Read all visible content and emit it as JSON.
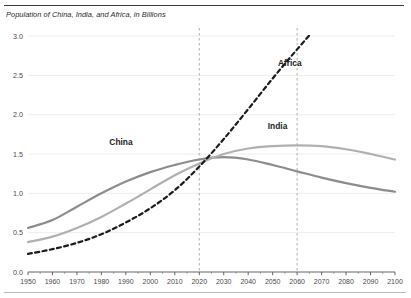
{
  "figure": {
    "title": "Population of China, India, and Africa, in Billions",
    "background": "#ffffff",
    "top_rule_color": "#3c3c3c",
    "bottom_rule_color": "#b9b9b9"
  },
  "chart_data": {
    "type": "line",
    "title": "Population of China, India, and Africa, in Billions",
    "xlabel": "",
    "ylabel": "",
    "xlim": [
      1950,
      2100
    ],
    "ylim": [
      0.0,
      3.0
    ],
    "grid": true,
    "grid_color": "#e8e8e8",
    "legend_position": "inline-annotations",
    "x": [
      1950,
      1960,
      1970,
      1980,
      1990,
      2000,
      2010,
      2020,
      2030,
      2040,
      2050,
      2060,
      2070,
      2080,
      2090,
      2100
    ],
    "xticks": [
      "1950",
      "1960",
      "1970",
      "1980",
      "1990",
      "2000",
      "2010",
      "2020",
      "2030",
      "2040",
      "2050",
      "2060",
      "2070",
      "2080",
      "2090",
      "2100"
    ],
    "yticks": [
      "0.0",
      "0.5",
      "1.0",
      "1.5",
      "2.0",
      "2.5",
      "3.0"
    ],
    "ytick_values": [
      0.0,
      0.5,
      1.0,
      1.5,
      2.0,
      2.5,
      3.0
    ],
    "series": [
      {
        "name": "China",
        "color": "#8c8c8c",
        "style": "solid",
        "width": 2.2,
        "label_x": 1988,
        "label_y": 1.62,
        "values": [
          0.56,
          0.66,
          0.83,
          1.0,
          1.15,
          1.27,
          1.36,
          1.43,
          1.46,
          1.43,
          1.36,
          1.28,
          1.2,
          1.13,
          1.07,
          1.02
        ]
      },
      {
        "name": "India",
        "color": "#b0b0b0",
        "style": "solid",
        "width": 2.2,
        "label_x": 2052,
        "label_y": 1.82,
        "values": [
          0.38,
          0.45,
          0.56,
          0.7,
          0.87,
          1.05,
          1.23,
          1.38,
          1.5,
          1.57,
          1.6,
          1.61,
          1.6,
          1.56,
          1.5,
          1.43
        ]
      },
      {
        "name": "Africa",
        "color": "#1c1c1c",
        "style": "dashed",
        "width": 2.2,
        "label_x": 2057,
        "label_y": 2.62,
        "values": [
          0.23,
          0.29,
          0.37,
          0.48,
          0.63,
          0.81,
          1.04,
          1.34,
          1.69,
          2.07,
          2.46,
          2.83,
          3.18,
          3.5,
          3.79,
          4.05
        ]
      }
    ],
    "reference_lines": [
      {
        "name": "year-2020",
        "x": 2020,
        "style": "dashed",
        "color": "#9a9a9a"
      },
      {
        "name": "year-2060",
        "x": 2060,
        "style": "dashed",
        "color": "#9a9a9a"
      }
    ]
  }
}
